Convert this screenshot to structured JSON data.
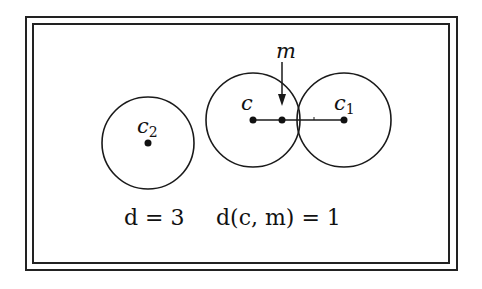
{
  "diagram": {
    "frame": {
      "style": "double-border"
    },
    "circles": [
      {
        "id": "c2",
        "label": "c",
        "subscript": "2",
        "cx": 148,
        "cy": 143,
        "r": 46
      },
      {
        "id": "c",
        "label": "c",
        "subscript": "",
        "cx": 253,
        "cy": 120,
        "r": 47
      },
      {
        "id": "c1",
        "label": "c",
        "subscript": "1",
        "cx": 344,
        "cy": 120,
        "r": 47
      }
    ],
    "points": [
      {
        "id": "c",
        "x": 253,
        "y": 120
      },
      {
        "id": "m",
        "x": 282,
        "y": 120
      },
      {
        "id": "c1",
        "x": 344,
        "y": 120
      },
      {
        "id": "c2",
        "x": 148,
        "y": 143
      }
    ],
    "segment": {
      "from": "c",
      "to": "c1"
    },
    "arrow": {
      "label": "m",
      "from_y": 60,
      "to_y": 105,
      "x": 282
    },
    "equations": {
      "d_label": "d = 3",
      "dcm_label": "d(c, m) = 1"
    },
    "colors": {
      "stroke": "#1a1a1a",
      "background": "#ffffff"
    }
  }
}
